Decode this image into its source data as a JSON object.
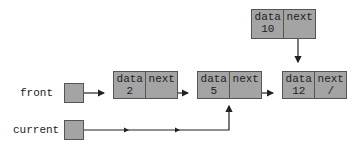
{
  "diagram": {
    "type": "linked-list",
    "colors": {
      "node_fill": "#a4a4a4",
      "stroke": "#222222",
      "background": "#ffffff"
    },
    "pointers": [
      {
        "id": "front",
        "label": "front",
        "points_to": "node-2"
      },
      {
        "id": "current",
        "label": "current",
        "points_to": "node-5"
      }
    ],
    "field_headers": {
      "data": "data",
      "next": "next"
    },
    "nodes": [
      {
        "id": "node-2",
        "data": "2",
        "next": "",
        "next_target": "node-5"
      },
      {
        "id": "node-5",
        "data": "5",
        "next": "",
        "next_target": "node-12"
      },
      {
        "id": "node-12",
        "data": "12",
        "next": "/",
        "next_target": null
      },
      {
        "id": "node-10",
        "data": "10",
        "next": "",
        "next_target": "node-12"
      }
    ]
  }
}
